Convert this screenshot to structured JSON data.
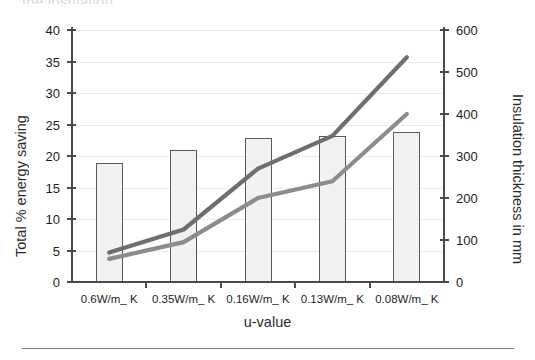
{
  "cropped_header_text": "the insulation",
  "chart_data": {
    "type": "bar",
    "title": "",
    "xlabel": "u-value",
    "ylabel": "Total % energy saving",
    "y2label": "Insulation thickness in mm",
    "grid": true,
    "legend": "none",
    "categories": [
      "0.6W/m_ K",
      "0.35W/m_ K",
      "0.16W/m_ K",
      "0.13W/m_ K",
      "0.08W/m_ K"
    ],
    "ylim": [
      0,
      40
    ],
    "yticks": [
      0,
      5,
      10,
      15,
      20,
      25,
      30,
      35,
      40
    ],
    "y2lim": [
      0,
      600
    ],
    "y2ticks": [
      0,
      100,
      200,
      300,
      400,
      500,
      600
    ],
    "series": [
      {
        "name": "Total % energy saving",
        "type": "bar",
        "axis": "left",
        "color": "#f1f1f1",
        "edge_color": "#5a5a5a",
        "values": [
          18.9,
          21.0,
          22.8,
          23.2,
          23.8
        ]
      },
      {
        "name": "Insulation thickness (upper)",
        "type": "line",
        "axis": "right",
        "color": "#6e6e6e",
        "values": [
          70,
          125,
          270,
          348,
          535
        ]
      },
      {
        "name": "Insulation thickness (lower)",
        "type": "line",
        "axis": "right",
        "color": "#8c8c8c",
        "values": [
          55,
          95,
          200,
          240,
          400
        ]
      }
    ]
  }
}
